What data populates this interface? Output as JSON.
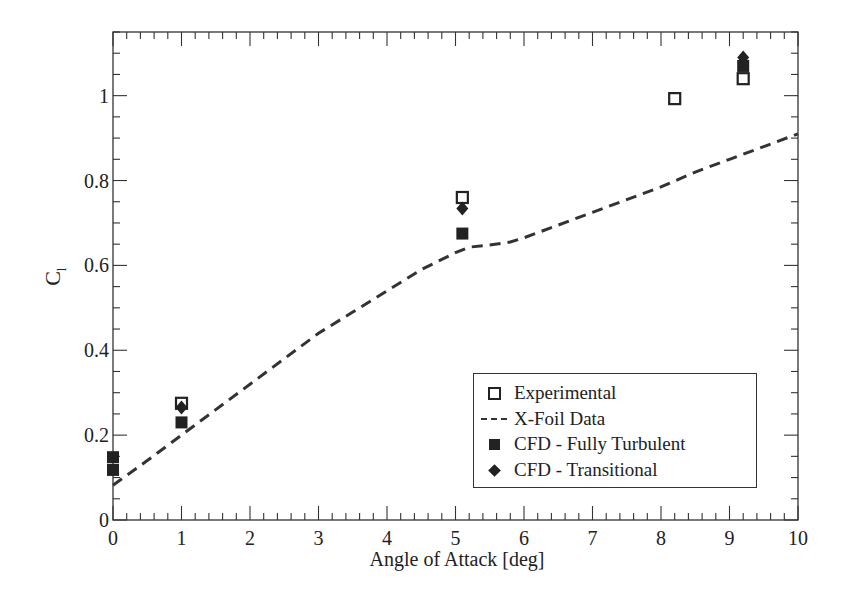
{
  "chart_data": {
    "type": "scatter",
    "title": "",
    "xlabel": "Angle of Attack [deg]",
    "ylabel": "C_l",
    "ylabel_main": "C",
    "ylabel_sub": "l",
    "xlim": [
      0,
      10
    ],
    "ylim": [
      0,
      1.15
    ],
    "grid": false,
    "legend_position": "lower right",
    "x_ticks": [
      0,
      1,
      2,
      3,
      4,
      5,
      6,
      7,
      8,
      9,
      10
    ],
    "x_tick_labels": [
      "0",
      "1",
      "2",
      "3",
      "4",
      "5",
      "6",
      "7",
      "8",
      "9",
      "10"
    ],
    "y_ticks": [
      0,
      0.2,
      0.4,
      0.6,
      0.8,
      1.0
    ],
    "y_tick_labels": [
      "0",
      "0.2",
      "0.4",
      "0.6",
      "0.8",
      "1"
    ],
    "series": [
      {
        "name": "Experimental",
        "marker": "open-square",
        "line": "none",
        "x": [
          1.0,
          5.1,
          8.2,
          9.2
        ],
        "y": [
          0.275,
          0.76,
          0.993,
          1.04
        ]
      },
      {
        "name": "X-Foil Data",
        "marker": "none",
        "line": "dashed",
        "x": [
          0,
          0.5,
          1.0,
          1.5,
          2.0,
          2.5,
          3.0,
          3.5,
          4.0,
          4.5,
          5.0,
          5.2,
          5.5,
          5.8,
          6.0,
          6.5,
          7.0,
          7.5,
          8.0,
          8.5,
          9.0,
          9.5,
          10.0
        ],
        "y": [
          0.082,
          0.14,
          0.2,
          0.26,
          0.32,
          0.38,
          0.44,
          0.49,
          0.54,
          0.59,
          0.63,
          0.643,
          0.648,
          0.655,
          0.665,
          0.695,
          0.725,
          0.755,
          0.785,
          0.82,
          0.85,
          0.88,
          0.91
        ]
      },
      {
        "name": "CFD - Fully Turbulent",
        "marker": "filled-square",
        "line": "none",
        "x": [
          0,
          0,
          1.0,
          5.1,
          9.2
        ],
        "y": [
          0.148,
          0.118,
          0.23,
          0.675,
          1.07
        ]
      },
      {
        "name": "CFD - Transitional",
        "marker": "filled-diamond",
        "line": "none",
        "x": [
          1.0,
          5.1,
          9.2
        ],
        "y": [
          0.265,
          0.734,
          1.09
        ]
      }
    ]
  },
  "legend": {
    "items": [
      {
        "label": "Experimental",
        "symbol": "open-square"
      },
      {
        "label": "X-Foil Data",
        "symbol": "dashed-line"
      },
      {
        "label": "CFD - Fully Turbulent",
        "symbol": "filled-square"
      },
      {
        "label": "CFD - Transitional",
        "symbol": "filled-diamond"
      }
    ]
  },
  "colors": {
    "ink": "#222222",
    "background": "#ffffff"
  }
}
